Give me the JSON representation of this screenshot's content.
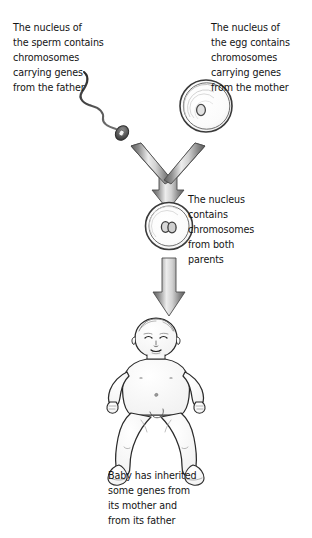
{
  "figure": {
    "background_color": "#ffffff",
    "line_color": "#1a1a1a",
    "arrow_dark": "#6a6a6a",
    "arrow_light": "#e8e8e8"
  },
  "captions": {
    "sperm": "The nucleus of\nthe sperm contains\nchromosomes\ncarrying genes\nfrom the father",
    "egg": "The nucleus of\nthe egg contains\nchromosomes\ncarrying genes\nfrom the mother",
    "zygote": "The nucleus\ncontains\nchromosomes\nfrom both\nparents",
    "baby": "Baby has inherited\nsome genes from\nits mother and\nfrom its father"
  },
  "illustrations": {
    "sperm_cell": "sperm-cell-illustration",
    "egg_cell": "egg-cell-illustration",
    "fertilized_cell": "fertilized-cell-illustration",
    "baby": "baby-illustration",
    "merge_arrow": "y-merge-arrow",
    "down_arrow": "down-arrow"
  }
}
